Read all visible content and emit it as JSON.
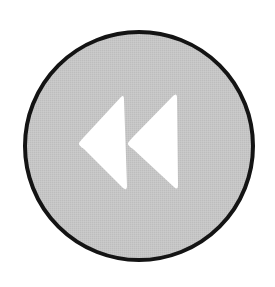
{
  "button": {
    "label": "Rewind",
    "icon": "rewind-icon",
    "shape": "circle",
    "colors": {
      "fill": "#c4c4c4",
      "border": "#141414",
      "glyph": "#ffffff",
      "background": "#ffffff"
    },
    "geometry": {
      "center_x": 139,
      "center_y": 146,
      "radius": 115,
      "border_width": 4
    }
  }
}
